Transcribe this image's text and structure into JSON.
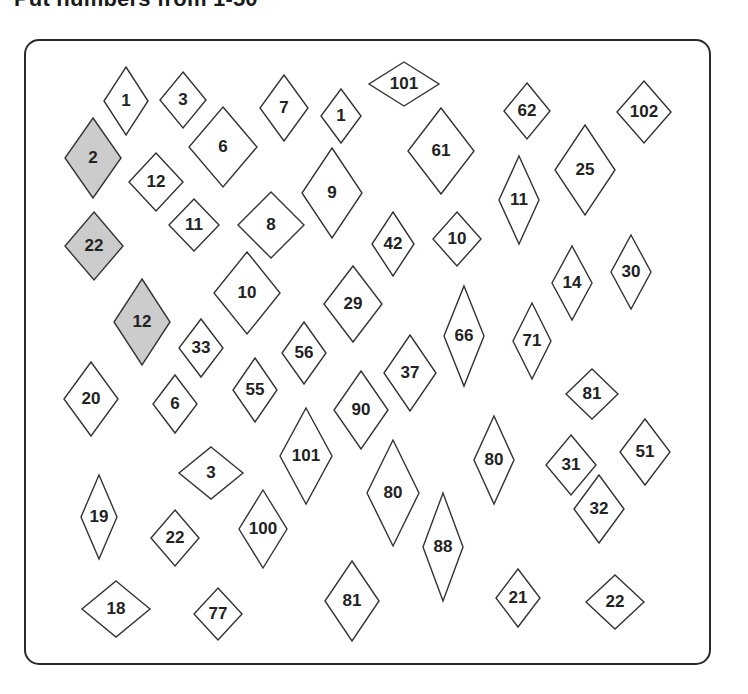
{
  "header": {
    "title": "Put numbers from 1-50"
  },
  "colors": {
    "border": "#2a2a2a",
    "diamond_stroke": "#333333",
    "filled": "#cccccc",
    "empty": "#ffffff",
    "text": "#222222"
  },
  "diamonds": [
    {
      "label": "1",
      "cx": 126,
      "cy": 101,
      "w": 22,
      "h": 34,
      "filled": false
    },
    {
      "label": "3",
      "cx": 183,
      "cy": 100,
      "w": 23,
      "h": 28,
      "filled": false
    },
    {
      "label": "7",
      "cx": 284,
      "cy": 108,
      "w": 24,
      "h": 33,
      "filled": false
    },
    {
      "label": "1",
      "cx": 341,
      "cy": 116,
      "w": 20,
      "h": 27,
      "filled": false
    },
    {
      "label": "101",
      "cx": 404,
      "cy": 84,
      "w": 35,
      "h": 22,
      "filled": false
    },
    {
      "label": "62",
      "cx": 527,
      "cy": 111,
      "w": 23,
      "h": 28,
      "filled": false
    },
    {
      "label": "102",
      "cx": 644,
      "cy": 112,
      "w": 27,
      "h": 31,
      "filled": false
    },
    {
      "label": "2",
      "cx": 93,
      "cy": 158,
      "w": 28,
      "h": 40,
      "filled": true
    },
    {
      "label": "6",
      "cx": 223,
      "cy": 147,
      "w": 34,
      "h": 40,
      "filled": false
    },
    {
      "label": "61",
      "cx": 441,
      "cy": 151,
      "w": 33,
      "h": 43,
      "filled": false
    },
    {
      "label": "12",
      "cx": 156,
      "cy": 182,
      "w": 27,
      "h": 29,
      "filled": false
    },
    {
      "label": "9",
      "cx": 332,
      "cy": 193,
      "w": 30,
      "h": 45,
      "filled": false
    },
    {
      "label": "11",
      "cx": 519,
      "cy": 200,
      "w": 20,
      "h": 44,
      "filled": false
    },
    {
      "label": "25",
      "cx": 585,
      "cy": 170,
      "w": 30,
      "h": 45,
      "filled": false
    },
    {
      "label": "11",
      "cx": 194,
      "cy": 225,
      "w": 25,
      "h": 26,
      "filled": false
    },
    {
      "label": "8",
      "cx": 271,
      "cy": 225,
      "w": 33,
      "h": 33,
      "filled": false
    },
    {
      "label": "22",
      "cx": 94,
      "cy": 246,
      "w": 29,
      "h": 34,
      "filled": true
    },
    {
      "label": "42",
      "cx": 393,
      "cy": 244,
      "w": 21,
      "h": 32,
      "filled": false
    },
    {
      "label": "10",
      "cx": 457,
      "cy": 239,
      "w": 24,
      "h": 27,
      "filled": false
    },
    {
      "label": "14",
      "cx": 572,
      "cy": 283,
      "w": 20,
      "h": 37,
      "filled": false
    },
    {
      "label": "30",
      "cx": 631,
      "cy": 272,
      "w": 20,
      "h": 37,
      "filled": false
    },
    {
      "label": "10",
      "cx": 247,
      "cy": 293,
      "w": 33,
      "h": 41,
      "filled": false
    },
    {
      "label": "29",
      "cx": 353,
      "cy": 304,
      "w": 29,
      "h": 38,
      "filled": false
    },
    {
      "label": "12",
      "cx": 142,
      "cy": 322,
      "w": 28,
      "h": 43,
      "filled": true
    },
    {
      "label": "66",
      "cx": 464,
      "cy": 336,
      "w": 20,
      "h": 50,
      "filled": false
    },
    {
      "label": "71",
      "cx": 532,
      "cy": 341,
      "w": 19,
      "h": 38,
      "filled": false
    },
    {
      "label": "33",
      "cx": 201,
      "cy": 348,
      "w": 22,
      "h": 29,
      "filled": false
    },
    {
      "label": "56",
      "cx": 304,
      "cy": 353,
      "w": 22,
      "h": 31,
      "filled": false
    },
    {
      "label": "37",
      "cx": 410,
      "cy": 373,
      "w": 26,
      "h": 38,
      "filled": false
    },
    {
      "label": "81",
      "cx": 592,
      "cy": 394,
      "w": 26,
      "h": 25,
      "filled": false
    },
    {
      "label": "20",
      "cx": 91,
      "cy": 399,
      "w": 27,
      "h": 37,
      "filled": false
    },
    {
      "label": "6",
      "cx": 175,
      "cy": 404,
      "w": 22,
      "h": 29,
      "filled": false
    },
    {
      "label": "55",
      "cx": 255,
      "cy": 390,
      "w": 22,
      "h": 32,
      "filled": false
    },
    {
      "label": "90",
      "cx": 361,
      "cy": 410,
      "w": 27,
      "h": 39,
      "filled": false
    },
    {
      "label": "101",
      "cx": 306,
      "cy": 456,
      "w": 26,
      "h": 48,
      "filled": false
    },
    {
      "label": "80",
      "cx": 494,
      "cy": 460,
      "w": 20,
      "h": 44,
      "filled": false
    },
    {
      "label": "31",
      "cx": 571,
      "cy": 465,
      "w": 25,
      "h": 30,
      "filled": false
    },
    {
      "label": "51",
      "cx": 645,
      "cy": 452,
      "w": 25,
      "h": 33,
      "filled": false
    },
    {
      "label": "3",
      "cx": 211,
      "cy": 473,
      "w": 32,
      "h": 26,
      "filled": false
    },
    {
      "label": "80",
      "cx": 393,
      "cy": 493,
      "w": 26,
      "h": 53,
      "filled": false
    },
    {
      "label": "32",
      "cx": 599,
      "cy": 509,
      "w": 25,
      "h": 34,
      "filled": false
    },
    {
      "label": "19",
      "cx": 99,
      "cy": 517,
      "w": 18,
      "h": 42,
      "filled": false
    },
    {
      "label": "22",
      "cx": 175,
      "cy": 538,
      "w": 24,
      "h": 28,
      "filled": false
    },
    {
      "label": "100",
      "cx": 263,
      "cy": 529,
      "w": 24,
      "h": 39,
      "filled": false
    },
    {
      "label": "88",
      "cx": 443,
      "cy": 547,
      "w": 20,
      "h": 54,
      "filled": false
    },
    {
      "label": "81",
      "cx": 352,
      "cy": 601,
      "w": 27,
      "h": 40,
      "filled": false
    },
    {
      "label": "21",
      "cx": 518,
      "cy": 598,
      "w": 22,
      "h": 29,
      "filled": false
    },
    {
      "label": "18",
      "cx": 116,
      "cy": 609,
      "w": 34,
      "h": 28,
      "filled": false
    },
    {
      "label": "77",
      "cx": 218,
      "cy": 614,
      "w": 24,
      "h": 26,
      "filled": false
    },
    {
      "label": "22",
      "cx": 615,
      "cy": 602,
      "w": 29,
      "h": 27,
      "filled": false
    }
  ]
}
